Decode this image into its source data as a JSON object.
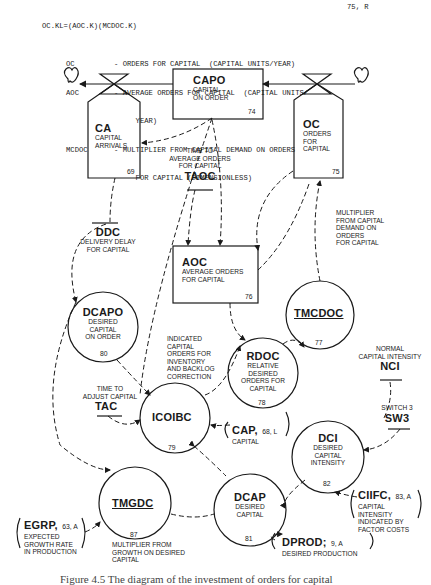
{
  "equation": {
    "formula": "OC.KL=(AOC.K)(MCDOC.K)",
    "number": "75, R",
    "definitions": [
      {
        "sym": "OC",
        "text": "- ORDERS FOR CAPITAL  (CAPITAL UNITS/YEAR)"
      },
      {
        "sym": "AOC",
        "text": "- AVERAGE ORDERS FOR CAPITAL  (CAPITAL UNITS/"
      },
      {
        "sym": "",
        "text": "     YEAR)"
      },
      {
        "sym": "MCDOC",
        "text": "- MULTIPLIER FROM CAPITAL DEMAND ON ORDERS"
      },
      {
        "sym": "",
        "text": "     FOR CAPITAL (DIMENSIONLESS)"
      }
    ]
  },
  "nodes": {
    "capo": {
      "abbr": "CAPO",
      "desc": "CAPITAL\nON ORDER",
      "num": "74",
      "type": "level"
    },
    "ca": {
      "abbr": "CA",
      "desc": "CAPITAL\nARRIVALS",
      "num": "69",
      "type": "rate"
    },
    "oc": {
      "abbr": "OC",
      "desc": "ORDERS\nFOR\nCAPITAL",
      "num": "75",
      "type": "rate"
    },
    "aoc": {
      "abbr": "AOC",
      "desc": "AVERAGE ORDERS\nFOR CAPITAL",
      "num": "76",
      "type": "level"
    },
    "tmcdoc": {
      "abbr": "TMCDOC",
      "num": "77",
      "type": "table",
      "desc": "MULTIPLIER\nFROM CAPITAL\nDEMAND ON\nORDERS\nFOR CAPITAL"
    },
    "dcapo": {
      "abbr": "DCAPO",
      "desc": "DESIRED\nCAPITAL\nON ORDER",
      "num": "80",
      "type": "aux"
    },
    "rdoc": {
      "abbr": "RDOC",
      "desc": "RELATIVE\nDESIRED\nORDERS FOR\nCAPITAL",
      "num": "78",
      "type": "aux"
    },
    "icoibc": {
      "abbr": "ICOIBC",
      "num": "79",
      "type": "aux",
      "desc": "INDICATED\nCAPITAL\nORDERS FOR\nINVENTORY\nAND BACKLOG\nCORRECTION"
    },
    "dci": {
      "abbr": "DCI",
      "desc": "DESIRED\nCAPITAL\nINTENSITY",
      "num": "82",
      "type": "aux"
    },
    "tmgdc": {
      "abbr": "TMGDC",
      "num": "87",
      "type": "table",
      "desc": "MULTIPLIER FROM\nGROWTH ON DESIRED\nCAPITAL"
    },
    "dcap": {
      "abbr": "DCAP",
      "desc": "DESIRED\nCAPITAL",
      "num": "81",
      "type": "aux"
    }
  },
  "constants": {
    "taoc": {
      "abbr": "TAOC",
      "desc": "TIME TO\nAVERAGE ORDERS\nFOR CAPITAL"
    },
    "ddc": {
      "abbr": "DDC",
      "desc": "DELIVERY DELAY\nFOR CAPITAL"
    },
    "tac": {
      "abbr": "TAC",
      "desc": "TIME TO\nADJUST CAPITAL"
    },
    "nci": {
      "abbr": "NCI",
      "desc": "NORMAL\nCAPITAL INTENSITY"
    },
    "sw3": {
      "abbr": "SW3",
      "desc": "SWITCH 3"
    }
  },
  "external": {
    "cap": {
      "abbr": "CAP,",
      "ref": "68, L",
      "desc": "CAPITAL"
    },
    "ciifc": {
      "abbr": "CIIFC,",
      "ref": "83, A",
      "desc": "CAPITAL\nINTENSITY\nINDICATED BY\nFACTOR COSTS"
    },
    "egrp": {
      "abbr": "EGRP,",
      "ref": "63, A",
      "desc": "EXPECTED\nGROWTH RATE\nIN PRODUCTION"
    },
    "dprod": {
      "abbr": "DPROD;",
      "ref": "9, A",
      "desc": "DESIRED PRODUCTION"
    }
  },
  "caption": "Figure 4.5  The diagram of the investment of orders for capital"
}
